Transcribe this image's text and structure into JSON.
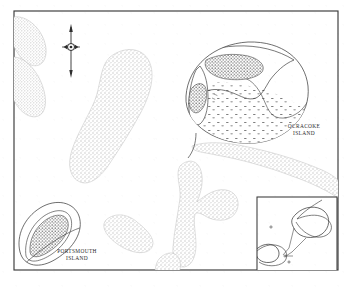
{
  "map": {
    "kind": "historical-coastal-map",
    "frame": {
      "stroke_color": "#3a3a3a",
      "background_color": "#ffffff"
    },
    "land": {
      "fill_color": "#d9d9d9",
      "stipple_color": "#b9b9b9",
      "outline_color": "#6e6e6e"
    },
    "settlement": {
      "fill_color": "#2d2d2d",
      "description": "dense building cluster stipple"
    },
    "labels": [
      {
        "name": "ocracoke-island-label",
        "line1": "OCRACOKE",
        "line2": "ISLAND",
        "x": 304,
        "y": 128
      },
      {
        "name": "portsmouth-island-label",
        "line1": "PORTSMOUTH",
        "line2": "ISLAND",
        "x": 77,
        "y": 253
      }
    ],
    "north_arrow": {
      "name": "north-arrow",
      "x": 71,
      "y": 27,
      "length": 47
    },
    "detail_circles": [
      {
        "name": "ocracoke-detail-circle",
        "label_ref": "OCRACOKE ISLAND"
      },
      {
        "name": "portsmouth-detail-circle",
        "label_ref": "PORTSMOUTH ISLAND"
      }
    ],
    "inset": {
      "name": "locator-inset",
      "x": 256,
      "y": 196,
      "width": 82,
      "height": 76
    },
    "caption": ""
  }
}
